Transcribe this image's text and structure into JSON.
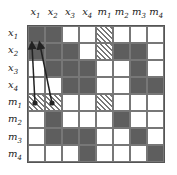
{
  "columns": [
    "x1",
    "x2",
    "x3",
    "x4",
    "m1",
    "m2",
    "m3",
    "m4"
  ],
  "rows": [
    "x1",
    "x2",
    "x3",
    "x4",
    "m1",
    "m2",
    "m3",
    "m4"
  ],
  "legend": {
    "D": "dark/filled",
    "W": "empty",
    "H": "hatched"
  },
  "matrix": [
    [
      "D",
      "D",
      "W",
      "W",
      "H",
      "W",
      "W",
      "W"
    ],
    [
      "D",
      "D",
      "D",
      "W",
      "H",
      "D",
      "D",
      "W"
    ],
    [
      "W",
      "D",
      "D",
      "D",
      "W",
      "W",
      "D",
      "W"
    ],
    [
      "W",
      "W",
      "D",
      "D",
      "W",
      "W",
      "D",
      "D"
    ],
    [
      "H",
      "H",
      "W",
      "W",
      "H",
      "W",
      "W",
      "W"
    ],
    [
      "W",
      "D",
      "W",
      "W",
      "W",
      "D",
      "W",
      "W"
    ],
    [
      "W",
      "D",
      "D",
      "D",
      "W",
      "W",
      "D",
      "W"
    ],
    [
      "W",
      "W",
      "W",
      "D",
      "W",
      "W",
      "W",
      "D"
    ]
  ],
  "arrows": [
    {
      "from": "m1,x1",
      "to": "x2,x1"
    },
    {
      "from": "m1,x2",
      "to": "x2,x2"
    }
  ],
  "colors": {
    "dark": "#5e5e5e",
    "grid": "#777777",
    "arrow": "#222222"
  }
}
